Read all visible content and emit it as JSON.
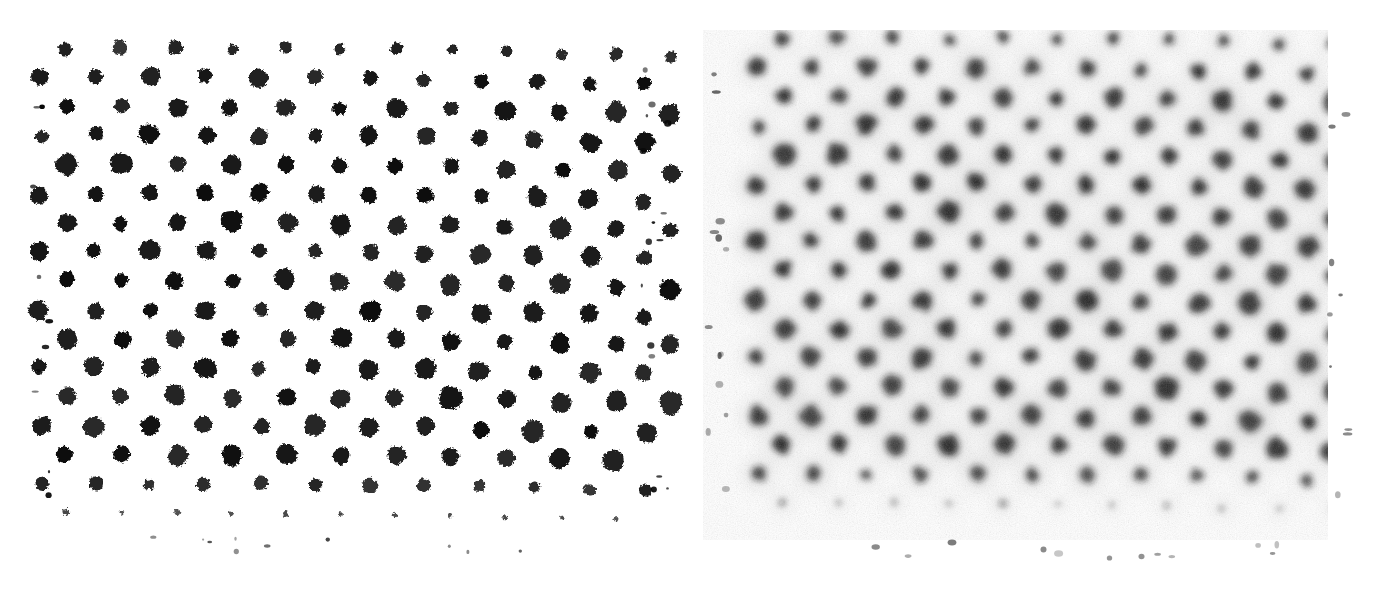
{
  "figure": {
    "background_color": "#ffffff",
    "dot_color": "#0d0d0d",
    "halo_color": "#8c8c8c",
    "width": 1393,
    "height": 589,
    "panel_count": 2
  },
  "panels": [
    {
      "id": "left",
      "name": "binarized-lattice-panel",
      "label": "",
      "rendering": "high-contrast binarized",
      "origin_x": 40,
      "origin_y": 52,
      "width": 620,
      "height": 480,
      "background_color": "#ffffff",
      "dot_color": "#080808",
      "blur_px": 0.8,
      "halo": false,
      "noise": false,
      "grain_opacity": 0.0
    },
    {
      "id": "right",
      "name": "raw-grainy-lattice-panel",
      "label": "",
      "rendering": "raw grainy with grey halos",
      "origin_x": 725,
      "origin_y": 42,
      "width": 625,
      "height": 500,
      "background_color": "#f7f7f7",
      "dot_color": "#1a1a1a",
      "blur_px": 3.2,
      "halo": true,
      "halo_color": "#9a9a9a",
      "noise": true,
      "grain_opacity": 0.42
    }
  ],
  "chart_data": {
    "type": "heatmap",
    "subtitle": "Left: thresholded / binarized. Right: as-acquired with grain and diffuse halos.",
    "xlabel": "",
    "ylabel": "",
    "grid": false,
    "legend": false,
    "lattice": {
      "symmetry": "triangular / hexagonal close packed",
      "a_px": 55.0,
      "row_spacing_px": 29.0,
      "row_offset_px": 27.5,
      "rotation_deg": 0.6,
      "rows": 17,
      "cols": 12,
      "dot_radius_mean_px": 9.4,
      "dot_radius_min_px": 5.5,
      "dot_radius_max_px": 13.0,
      "edge_fade_rows": 2
    },
    "panel_rows": [
      {
        "row": 0,
        "y": 52,
        "x_start": 62,
        "n": 12,
        "radius_scale": 0.66,
        "opacity": 0.95
      },
      {
        "row": 1,
        "y": 81,
        "x_start": 36,
        "n": 12,
        "radius_scale": 0.92,
        "opacity": 1.0
      },
      {
        "row": 2,
        "y": 110,
        "x_start": 62,
        "n": 12,
        "radius_scale": 1.0,
        "opacity": 1.0
      },
      {
        "row": 3,
        "y": 139,
        "x_start": 36,
        "n": 12,
        "radius_scale": 0.95,
        "opacity": 1.0
      },
      {
        "row": 4,
        "y": 168,
        "x_start": 62,
        "n": 12,
        "radius_scale": 1.02,
        "opacity": 1.0
      },
      {
        "row": 5,
        "y": 197,
        "x_start": 36,
        "n": 12,
        "radius_scale": 0.96,
        "opacity": 1.0
      },
      {
        "row": 6,
        "y": 226,
        "x_start": 62,
        "n": 12,
        "radius_scale": 1.0,
        "opacity": 1.0
      },
      {
        "row": 7,
        "y": 255,
        "x_start": 36,
        "n": 12,
        "radius_scale": 0.94,
        "opacity": 1.0
      },
      {
        "row": 8,
        "y": 284,
        "x_start": 62,
        "n": 12,
        "radius_scale": 1.03,
        "opacity": 1.0
      },
      {
        "row": 9,
        "y": 313,
        "x_start": 36,
        "n": 12,
        "radius_scale": 0.97,
        "opacity": 1.0
      },
      {
        "row": 10,
        "y": 342,
        "x_start": 62,
        "n": 12,
        "radius_scale": 1.01,
        "opacity": 1.0
      },
      {
        "row": 11,
        "y": 371,
        "x_start": 36,
        "n": 12,
        "radius_scale": 0.98,
        "opacity": 1.0
      },
      {
        "row": 12,
        "y": 400,
        "x_start": 62,
        "n": 12,
        "radius_scale": 1.05,
        "opacity": 1.0
      },
      {
        "row": 13,
        "y": 429,
        "x_start": 36,
        "n": 12,
        "radius_scale": 1.0,
        "opacity": 1.0
      },
      {
        "row": 14,
        "y": 458,
        "x_start": 62,
        "n": 12,
        "radius_scale": 1.02,
        "opacity": 1.0
      },
      {
        "row": 15,
        "y": 487,
        "x_start": 36,
        "n": 12,
        "radius_scale": 0.72,
        "opacity": 0.92
      },
      {
        "row": 16,
        "y": 516,
        "x_start": 62,
        "n": 11,
        "radius_scale": 0.3,
        "opacity": 0.72
      }
    ]
  }
}
